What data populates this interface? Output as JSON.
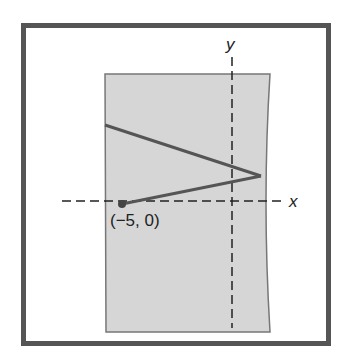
{
  "diagram": {
    "axes": {
      "x_label": "x",
      "y_label": "y"
    },
    "point": {
      "label": "(−5, 0)",
      "x": -5,
      "y": 0
    },
    "colors": {
      "frame": "#555555",
      "shaded_region": "#d6d6d6",
      "region_border": "#777777",
      "line": "#555555",
      "axis": "#222222"
    }
  }
}
